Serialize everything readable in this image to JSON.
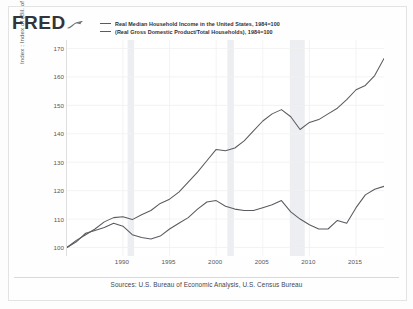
{
  "brand": {
    "logo_text": "FRED",
    "mark_icon": "fred-squiggle-icon"
  },
  "legend": {
    "entries": [
      {
        "label": "Real Median Household Income in the United States, 1984=100",
        "color": "#5a5b60",
        "icon": "legend-line-icon"
      },
      {
        "label": "(Real Gross Domestic Product/Total Households), 1984=100",
        "color": "#5a5b60",
        "icon": "legend-line-icon"
      }
    ]
  },
  "axes": {
    "y_title": "Index : Index of (Bil. of Chn. 2012 $/Thous.)",
    "y_ticks": [
      "170",
      "160",
      "150",
      "140",
      "130",
      "120",
      "110",
      "100"
    ],
    "x_ticks": [
      "1990",
      "1995",
      "2000",
      "2005",
      "2010",
      "2015"
    ]
  },
  "footer": {
    "source": "Sources: U.S. Bureau of Economic Analysis, U.S. Census Bureau"
  },
  "chart_data": {
    "type": "line",
    "title": "",
    "xlabel": "",
    "ylabel": "Index : Index of (Bil. of Chn. 2012 $/Thous.)",
    "xlim": [
      1984,
      2018
    ],
    "ylim": [
      97,
      173
    ],
    "ytick_values": [
      100,
      110,
      120,
      130,
      140,
      150,
      160,
      170
    ],
    "xtick_values": [
      1990,
      1995,
      2000,
      2005,
      2010,
      2015
    ],
    "grid": true,
    "legend_position": "top",
    "series": [
      {
        "name": "(Real Gross Domestic Product/Total Households), 1984=100",
        "color": "#5a5b60",
        "x": [
          1984,
          1985,
          1986,
          1987,
          1988,
          1989,
          1990,
          1991,
          1992,
          1993,
          1994,
          1995,
          1996,
          1997,
          1998,
          1999,
          2000,
          2001,
          2002,
          2003,
          2004,
          2005,
          2006,
          2007,
          2008,
          2009,
          2010,
          2011,
          2012,
          2013,
          2014,
          2015,
          2016,
          2017,
          2018
        ],
        "values": [
          100.0,
          102.5,
          104.5,
          106.5,
          109.0,
          110.5,
          110.8,
          109.8,
          111.5,
          113.0,
          115.5,
          117.0,
          119.5,
          123.0,
          126.5,
          130.5,
          134.5,
          134.0,
          135.0,
          137.5,
          141.0,
          144.5,
          147.0,
          148.5,
          146.0,
          141.5,
          144.0,
          145.0,
          147.0,
          149.0,
          152.0,
          155.5,
          157.0,
          160.5,
          166.5
        ]
      },
      {
        "name": "Real Median Household Income in the United States, 1984=100",
        "color": "#5a5b60",
        "x": [
          1984,
          1985,
          1986,
          1987,
          1988,
          1989,
          1990,
          1991,
          1992,
          1993,
          1994,
          1995,
          1996,
          1997,
          1998,
          1999,
          2000,
          2001,
          2002,
          2003,
          2004,
          2005,
          2006,
          2007,
          2008,
          2009,
          2010,
          2011,
          2012,
          2013,
          2014,
          2015,
          2016,
          2017,
          2018
        ],
        "values": [
          100.0,
          102.0,
          105.0,
          106.0,
          107.0,
          108.5,
          107.5,
          104.5,
          103.5,
          103.0,
          104.0,
          106.5,
          108.5,
          110.5,
          113.5,
          116.0,
          116.5,
          114.5,
          113.5,
          113.0,
          113.0,
          114.0,
          115.0,
          116.5,
          112.5,
          110.0,
          108.0,
          106.5,
          106.5,
          109.5,
          108.5,
          114.0,
          118.5,
          120.5,
          121.5
        ]
      }
    ],
    "recession_bands": [
      {
        "start": 1990.5,
        "end": 1991.2
      },
      {
        "start": 2001.2,
        "end": 2001.9
      },
      {
        "start": 2007.9,
        "end": 2009.5
      }
    ]
  }
}
